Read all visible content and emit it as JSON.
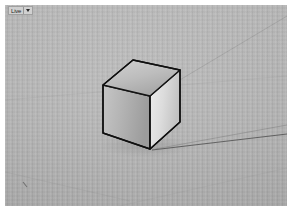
{
  "window": {
    "background_color": "#ffffff",
    "frame_color": "#ffffff"
  },
  "viewport": {
    "name": "3d-modeling-viewport",
    "background_color": "#b5b5b5",
    "ground_color": "#b2b2b2",
    "label": {
      "text": "Live",
      "caret_icon": "chevron-down-icon"
    }
  },
  "scene": {
    "axes": [
      {
        "name": "green-axis",
        "color": "#6b6b6b",
        "x1": 148,
        "y1": 146,
        "x2": 282,
        "y2": 122,
        "width": 0.9,
        "opacity": 0.55
      },
      {
        "name": "red-axis",
        "color": "#4a4a4a",
        "x1": 148,
        "y1": 146,
        "x2": 282,
        "y2": 131,
        "width": 0.9,
        "opacity": 0.85
      },
      {
        "name": "blue-axis-upper",
        "color": "#7a7a7a",
        "x1": 168,
        "y1": 78,
        "x2": 282,
        "y2": 14,
        "width": 0.8,
        "opacity": 0.4
      },
      {
        "name": "horizon-line",
        "color": "#8a8a8a",
        "x1": 0,
        "y1": 96,
        "x2": 282,
        "y2": 72,
        "width": 0.7,
        "opacity": 0.22
      },
      {
        "name": "ground-guide-lower-left",
        "color": "#8a8a8a",
        "x1": 0,
        "y1": 170,
        "x2": 120,
        "y2": 196,
        "width": 0.7,
        "opacity": 0.3
      },
      {
        "name": "ground-guide-lower-right",
        "color": "#8a8a8a",
        "x1": 120,
        "y1": 203,
        "x2": 282,
        "y2": 166,
        "width": 0.7,
        "opacity": 0.22
      }
    ],
    "cube": {
      "name": "cube-model",
      "edge_color": "#111111",
      "edge_width": 1.4,
      "top_face": {
        "name": "cube-top-face",
        "points": "128,56 175,66 145,92 98,81",
        "fill_from": "#cfcfcf",
        "fill_to": "#a8a8a8"
      },
      "left_face": {
        "name": "cube-left-face",
        "points": "98,81 145,92 145,145 98,129",
        "fill_from": "#c2c2c2",
        "fill_to": "#9e9e9e"
      },
      "right_face": {
        "name": "cube-right-face",
        "points": "145,92 175,66 175,118 145,145",
        "fill_from": "#e8e8e8",
        "fill_to": "#c6c6c6"
      }
    },
    "shadow": {
      "name": "cube-ground-shadow",
      "color": "#9a9a9a",
      "opacity": 0.35
    }
  }
}
